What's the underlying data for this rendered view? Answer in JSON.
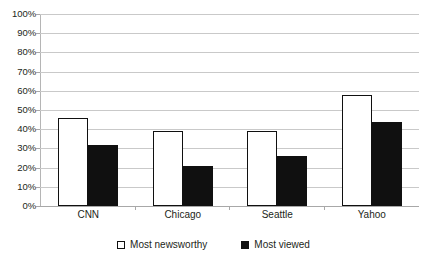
{
  "chart_data": {
    "type": "bar",
    "title": "",
    "subtitle": "",
    "xlabel": "",
    "ylabel": "",
    "categories": [
      "CNN",
      "Chicago",
      "Seattle",
      "Yahoo"
    ],
    "series": [
      {
        "name": "Most newsworthy",
        "values": [
          46,
          39,
          39,
          58
        ],
        "color": "#ffffff",
        "border": "#101010"
      },
      {
        "name": "Most viewed",
        "values": [
          32,
          21,
          26,
          44
        ],
        "color": "#101010",
        "border": "#101010"
      }
    ],
    "ylim": [
      0,
      100
    ],
    "ytick_step": 10,
    "ytick_labels": [
      "100%",
      "90%",
      "80%",
      "70%",
      "60%",
      "50%",
      "40%",
      "30%",
      "20%",
      "10%",
      "0%"
    ],
    "ytick_values": [
      100,
      90,
      80,
      70,
      60,
      50,
      40,
      30,
      20,
      10,
      0
    ],
    "value_suffix": "%",
    "grid": true,
    "grid_color": "#c9c9c9",
    "legend_position": "bottom",
    "legend": [
      "Most newsworthy",
      "Most viewed"
    ],
    "background": "#ffffff"
  }
}
